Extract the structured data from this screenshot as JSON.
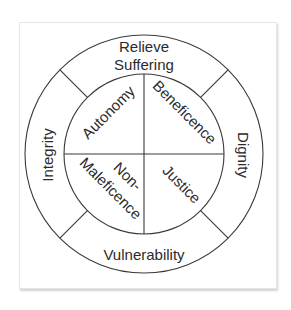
{
  "diagram": {
    "type": "concentric-wheel",
    "colors": {
      "stroke": "#3a3a3a",
      "text": "#2b2b2b",
      "background": "#ffffff"
    },
    "inner_ring": {
      "quadrants": [
        {
          "position": "top-left",
          "label": "Autonomy"
        },
        {
          "position": "top-right",
          "label": "Beneficence"
        },
        {
          "position": "bottom-left",
          "label_line1": "Non-",
          "label_line2": "Maleficence"
        },
        {
          "position": "bottom-right",
          "label": "Justice"
        }
      ]
    },
    "outer_ring": {
      "segments": [
        {
          "position": "top",
          "label_line1": "Relieve",
          "label_line2": "Suffering"
        },
        {
          "position": "right",
          "label": "Dignity"
        },
        {
          "position": "bottom",
          "label": "Vulnerability"
        },
        {
          "position": "left",
          "label": "Integrity"
        }
      ]
    }
  }
}
